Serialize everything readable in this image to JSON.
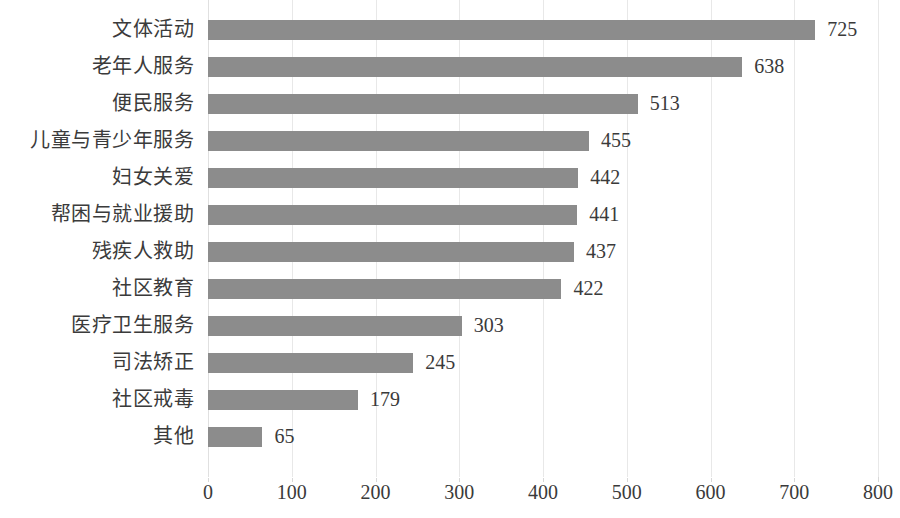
{
  "chart_data": {
    "type": "bar",
    "orientation": "horizontal",
    "title": "",
    "subtitle": "",
    "xlabel": "",
    "ylabel": "",
    "categories": [
      "文体活动",
      "老年人服务",
      "便民服务",
      "儿童与青少年服务",
      "妇女关爱",
      "帮困与就业援助",
      "残疾人救助",
      "社区教育",
      "医疗卫生服务",
      "司法矫正",
      "社区戒毒",
      "其他"
    ],
    "values": [
      725,
      638,
      513,
      455,
      442,
      441,
      437,
      422,
      303,
      245,
      179,
      65
    ],
    "data_labels": [
      "725",
      "638",
      "513",
      "455",
      "442",
      "441",
      "437",
      "422",
      "303",
      "245",
      "179",
      "65"
    ],
    "xlim": [
      0,
      800
    ],
    "xticks": [
      0,
      100,
      200,
      300,
      400,
      500,
      600,
      700,
      800
    ],
    "xtick_labels": [
      "0",
      "100",
      "200",
      "300",
      "400",
      "500",
      "600",
      "700",
      "800"
    ],
    "grid": true,
    "grid_axis": "x",
    "legend": false,
    "legend_position": "none",
    "bar_color": "#8c8c8c",
    "grid_color": "#e8e8e8",
    "text_color": "#3a3a3a",
    "background_color": "#ffffff"
  },
  "axis": {
    "x_tick_0": "0",
    "x_tick_1": "100",
    "x_tick_2": "200",
    "x_tick_3": "300",
    "x_tick_4": "400",
    "x_tick_5": "500",
    "x_tick_6": "600",
    "x_tick_7": "700",
    "x_tick_8": "800"
  }
}
